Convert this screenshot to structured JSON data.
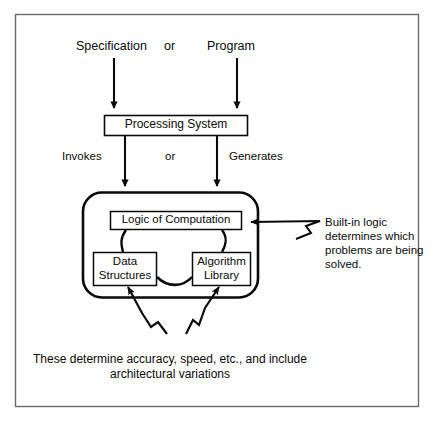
{
  "figure": {
    "frame": {
      "stroke": "#555555"
    },
    "ink": "#0a0a0a",
    "inputs": {
      "left_label": "Specification",
      "conjunction": "or",
      "right_label": "Program"
    },
    "processing_box": {
      "label": "Processing System"
    },
    "relations": {
      "left_label": "Invokes",
      "conjunction": "or",
      "right_label": "Generates"
    },
    "engine": {
      "logic_box": "Logic of Computation",
      "data_box_line1": "Data",
      "data_box_line2": "Structures",
      "algorithm_box_line1": "Algorithm",
      "algorithm_box_line2": "Library"
    },
    "callout_right": {
      "line1": "Built-in logic",
      "line2": "determines which",
      "line3": "problems are being",
      "line4": "solved."
    },
    "caption_bottom": {
      "line1": "These determine accuracy, speed, etc., and include",
      "line2": "architectural variations"
    }
  }
}
